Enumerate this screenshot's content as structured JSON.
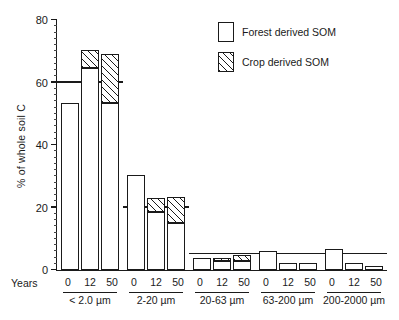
{
  "chart_data": {
    "type": "bar",
    "title": "",
    "subtitle": "",
    "xlabel": "Years",
    "ylabel": "% of whole soil C",
    "ylim": [
      0,
      80
    ],
    "yticks": [
      0,
      20,
      40,
      60,
      80
    ],
    "ytick_labels": [
      "0",
      "20",
      "40",
      "60",
      "80"
    ],
    "minor_tick_step": 2,
    "grid": false,
    "stacked": true,
    "legend_position": "top-right",
    "legend": [
      {
        "name": "Forest derived SOM",
        "fill": "white"
      },
      {
        "name": "Crop derived SOM",
        "fill": "diagonal-hatch"
      }
    ],
    "groups": [
      {
        "name": "< 2.0 µm",
        "x": [
          "0",
          "12",
          "50"
        ]
      },
      {
        "name": "2-20 µm",
        "x": [
          "0",
          "12",
          "50"
        ]
      },
      {
        "name": "20-63 µm",
        "x": [
          "0",
          "12",
          "50"
        ]
      },
      {
        "name": "63-200 µm",
        "x": [
          "0",
          "12",
          "50"
        ]
      },
      {
        "name": "200-2000 µm",
        "x": [
          "0",
          "12",
          "50"
        ]
      }
    ],
    "categories": [
      "< 2.0 µm 0",
      "< 2.0 µm 12",
      "< 2.0 µm 50",
      "2-20 µm 0",
      "2-20 µm 12",
      "2-20 µm 50",
      "20-63 µm 0",
      "20-63 µm 12",
      "20-63 µm 50",
      "63-200 µm 0",
      "63-200 µm 12",
      "63-200 µm 50",
      "200-2000 µm 0",
      "200-2000 µm 12",
      "200-2000 µm 50"
    ],
    "series": [
      {
        "name": "Forest derived SOM",
        "values": [
          53.5,
          64.5,
          53.5,
          30.5,
          18.5,
          15.0,
          4.0,
          3.0,
          3.0,
          6.0,
          2.3,
          2.2,
          6.7,
          2.4,
          1.4
        ]
      },
      {
        "name": "Crop derived SOM",
        "values": [
          0.0,
          6.0,
          15.5,
          0.0,
          4.5,
          8.5,
          0.0,
          0.8,
          1.8,
          0.0,
          0.0,
          0.0,
          0.0,
          0.0,
          0.0
        ]
      }
    ],
    "totals": [
      53.5,
      70.5,
      69.0,
      30.5,
      23.0,
      23.5,
      4.0,
      3.8,
      4.8,
      6.0,
      2.3,
      2.2,
      6.7,
      2.4,
      1.4
    ]
  },
  "axis": {
    "years_word": "Years"
  },
  "colors": {
    "ink": "#1a1a1a",
    "background": "#ffffff"
  }
}
